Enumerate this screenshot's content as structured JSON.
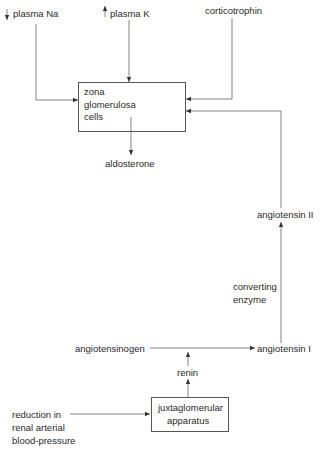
{
  "diagram": {
    "inputs": {
      "plasma_na": {
        "label": "plasma Na",
        "direction": "decrease"
      },
      "plasma_k": {
        "label": "plasma K",
        "direction": "increase"
      },
      "corticotrophin": {
        "label": "corticotrophin"
      }
    },
    "zona_box": {
      "lines": [
        "zona",
        "glomerulosa",
        "cells"
      ]
    },
    "aldosterone": "aldosterone",
    "angiotensin_ii": "angiotensin II",
    "converting_enzyme": {
      "lines": [
        "converting",
        "enzyme"
      ]
    },
    "angiotensin_i": "angiotensin I",
    "angiotensinogen": "angiotensinogen",
    "renin": "renin",
    "jg_box": {
      "lines": [
        "juxtaglomerular",
        "apparatus"
      ]
    },
    "reduction": {
      "lines": [
        "reduction in",
        "renal arterial",
        "blood-pressure"
      ]
    },
    "colors": {
      "line": "#666666",
      "text": "#2a2a2a"
    }
  }
}
